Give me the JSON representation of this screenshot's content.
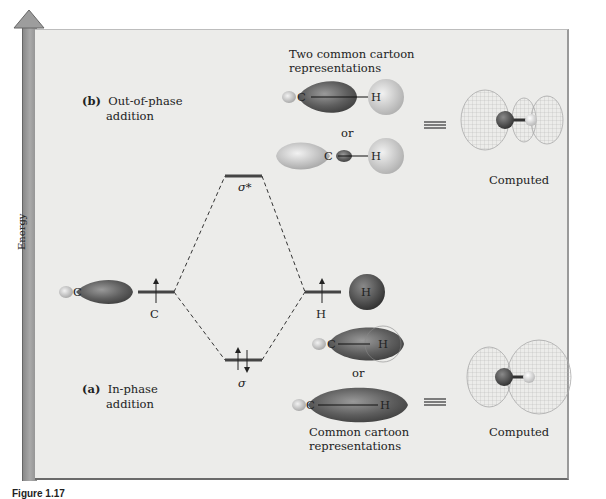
{
  "axis": {
    "label": "Energy"
  },
  "section_b": {
    "tag": "(b)",
    "title_line1": "Out-of-phase",
    "title_line2": "addition",
    "cartoon_heading_line1": "Two common cartoon",
    "cartoon_heading_line2": "representations",
    "or": "or",
    "computed": "Computed"
  },
  "section_a": {
    "tag": "(a)",
    "title_line1": "In-phase",
    "title_line2": "addition",
    "cartoon_heading_line1": "Common cartoon",
    "cartoon_heading_line2": "representations",
    "or": "or",
    "computed": "Computed"
  },
  "levels": {
    "sigma_star": "σ*",
    "sigma": "σ",
    "carbon": "C",
    "hydrogen": "H"
  },
  "atoms": {
    "C": "C",
    "H": "H"
  },
  "equivalence_symbol": "≡",
  "caption": "Figure 1.17"
}
